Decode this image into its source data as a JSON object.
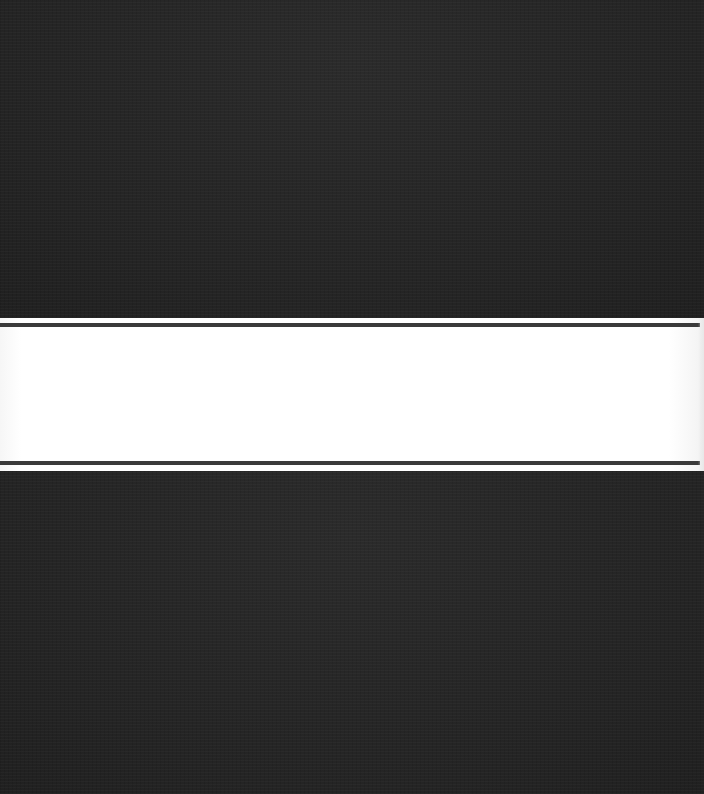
{
  "scene": {
    "description": "Dark textured surface with a horizontal white band bordered by two thin dark rules",
    "colors": {
      "dark_surface": "#262626",
      "band": "#ffffff",
      "rule": "#3a3a3a"
    }
  }
}
